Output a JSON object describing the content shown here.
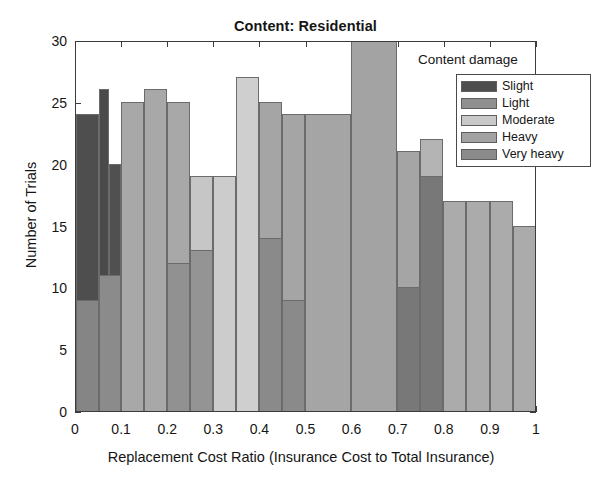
{
  "chart_data": {
    "type": "bar",
    "title": "Content: Residential",
    "xlabel": "Replacement Cost Ratio (Insurance Cost to Total Insurance)",
    "ylabel": "Number of Trials",
    "xlim": [
      0,
      1
    ],
    "ylim": [
      0,
      30
    ],
    "xticks": [
      "0",
      "0.1",
      "0.2",
      "0.3",
      "0.4",
      "0.5",
      "0.6",
      "0.7",
      "0.8",
      "0.9",
      "1"
    ],
    "xtick_values": [
      0,
      0.1,
      0.2,
      0.3,
      0.4,
      0.5,
      0.6,
      0.7,
      0.8,
      0.9,
      1
    ],
    "yticks": [
      "0",
      "5",
      "10",
      "15",
      "20",
      "25",
      "30"
    ],
    "ytick_values": [
      0,
      5,
      10,
      15,
      20,
      25,
      30
    ],
    "grid": false,
    "legend_title": "Content damage",
    "legend_position": "top-right-inside",
    "bin_width": 0.05,
    "series": [
      {
        "name": "Slight",
        "color": "#4e4e4e",
        "bars": [
          {
            "x0": 0.0,
            "x1": 0.05,
            "value": 24
          },
          {
            "x0": 0.05,
            "x1": 0.075,
            "value": 26
          },
          {
            "x0": 0.075,
            "x1": 0.1,
            "value": 20
          }
        ]
      },
      {
        "name": "Light",
        "color": "#8f8f8f",
        "bars": [
          {
            "x0": 0.0,
            "x1": 0.05,
            "value": 9
          },
          {
            "x0": 0.05,
            "x1": 0.1,
            "value": 11
          },
          {
            "x0": 0.1,
            "x1": 0.15,
            "value": 25
          },
          {
            "x0": 0.15,
            "x1": 0.2,
            "value": 26
          },
          {
            "x0": 0.2,
            "x1": 0.25,
            "value": 25
          },
          {
            "x0": 0.25,
            "x1": 0.3,
            "value": 19
          },
          {
            "x0": 0.3,
            "x1": 0.35,
            "value": 19
          }
        ]
      },
      {
        "name": "Moderate",
        "color": "#c2c2c2",
        "bars": [
          {
            "x0": 0.2,
            "x1": 0.25,
            "value": 12
          },
          {
            "x0": 0.25,
            "x1": 0.3,
            "value": 13
          },
          {
            "x0": 0.3,
            "x1": 0.35,
            "value": 19
          },
          {
            "x0": 0.35,
            "x1": 0.4,
            "value": 27
          },
          {
            "x0": 0.4,
            "x1": 0.45,
            "value": 25
          },
          {
            "x0": 0.75,
            "x1": 0.8,
            "value": 22
          },
          {
            "x0": 0.8,
            "x1": 0.85,
            "value": 17
          },
          {
            "x0": 0.85,
            "x1": 0.9,
            "value": 17
          },
          {
            "x0": 0.9,
            "x1": 0.95,
            "value": 17
          },
          {
            "x0": 0.95,
            "x1": 1.0,
            "value": 15
          }
        ]
      },
      {
        "name": "Heavy",
        "color": "#9e9e9e",
        "bars": [
          {
            "x0": 0.4,
            "x1": 0.45,
            "value": 14
          },
          {
            "x0": 0.45,
            "x1": 0.5,
            "value": 9
          },
          {
            "x0": 0.45,
            "x1": 0.5,
            "value": 25
          },
          {
            "x0": 0.5,
            "x1": 0.6,
            "value": 24
          },
          {
            "x0": 0.6,
            "x1": 0.7,
            "value": 30
          },
          {
            "x0": 0.7,
            "x1": 0.75,
            "value": 21
          },
          {
            "x0": 0.75,
            "x1": 0.8,
            "value": 19
          }
        ]
      },
      {
        "name": "Very heavy",
        "color": "#777777",
        "bars": [
          {
            "x0": 0.7,
            "x1": 0.75,
            "value": 10
          },
          {
            "x0": 0.75,
            "x1": 0.8,
            "value": 19
          }
        ]
      }
    ],
    "legend_entries": [
      {
        "label": "Slight",
        "color": "#4e4e4e"
      },
      {
        "label": "Light",
        "color": "#8f8f8f"
      },
      {
        "label": "Moderate",
        "color": "#c9c9c9"
      },
      {
        "label": "Heavy",
        "color": "#a2a2a2"
      },
      {
        "label": "Very heavy",
        "color": "#8a8a8a"
      }
    ],
    "drawn_bars": [
      {
        "x0": 0.0,
        "x1": 0.05,
        "value": 24,
        "color": "#4e4e4e",
        "z": 3
      },
      {
        "x0": 0.05,
        "x1": 0.072,
        "value": 26,
        "color": "#4a4a4a",
        "z": 4
      },
      {
        "x0": 0.072,
        "x1": 0.097,
        "value": 20,
        "color": "#505050",
        "z": 4
      },
      {
        "x0": 0.0,
        "x1": 0.05,
        "value": 9,
        "color": "#858585",
        "z": 5
      },
      {
        "x0": 0.05,
        "x1": 0.097,
        "value": 11,
        "color": "#8b8b8b",
        "z": 5
      },
      {
        "x0": 0.097,
        "x1": 0.147,
        "value": 25,
        "color": "#a8a8a8",
        "z": 2
      },
      {
        "x0": 0.147,
        "x1": 0.197,
        "value": 26,
        "color": "#a8a8a8",
        "z": 2
      },
      {
        "x0": 0.197,
        "x1": 0.247,
        "value": 25,
        "color": "#a8a8a8",
        "z": 2
      },
      {
        "x0": 0.197,
        "x1": 0.247,
        "value": 12,
        "color": "#919191",
        "z": 5
      },
      {
        "x0": 0.247,
        "x1": 0.297,
        "value": 19,
        "color": "#c6c6c6",
        "z": 2
      },
      {
        "x0": 0.247,
        "x1": 0.297,
        "value": 13,
        "color": "#949494",
        "z": 5
      },
      {
        "x0": 0.297,
        "x1": 0.347,
        "value": 19,
        "color": "#cccccc",
        "z": 2
      },
      {
        "x0": 0.347,
        "x1": 0.397,
        "value": 27,
        "color": "#cfcfcf",
        "z": 2
      },
      {
        "x0": 0.397,
        "x1": 0.447,
        "value": 25,
        "color": "#a5a5a5",
        "z": 2
      },
      {
        "x0": 0.397,
        "x1": 0.447,
        "value": 14,
        "color": "#8a8a8a",
        "z": 5
      },
      {
        "x0": 0.447,
        "x1": 0.497,
        "value": 24,
        "color": "#a5a5a5",
        "z": 2
      },
      {
        "x0": 0.447,
        "x1": 0.497,
        "value": 9,
        "color": "#8a8a8a",
        "z": 5
      },
      {
        "x0": 0.497,
        "x1": 0.597,
        "value": 24,
        "color": "#a5a5a5",
        "z": 2
      },
      {
        "x0": 0.597,
        "x1": 0.697,
        "value": 30,
        "color": "#a3a3a3",
        "z": 2
      },
      {
        "x0": 0.697,
        "x1": 0.747,
        "value": 21,
        "color": "#a5a5a5",
        "z": 2
      },
      {
        "x0": 0.697,
        "x1": 0.747,
        "value": 10,
        "color": "#787878",
        "z": 5
      },
      {
        "x0": 0.747,
        "x1": 0.797,
        "value": 22,
        "color": "#b4b4b4",
        "z": 2
      },
      {
        "x0": 0.747,
        "x1": 0.797,
        "value": 19,
        "color": "#787878",
        "z": 5
      },
      {
        "x0": 0.797,
        "x1": 0.847,
        "value": 17,
        "color": "#ababab",
        "z": 2
      },
      {
        "x0": 0.847,
        "x1": 0.897,
        "value": 17,
        "color": "#ababab",
        "z": 2
      },
      {
        "x0": 0.897,
        "x1": 0.947,
        "value": 17,
        "color": "#ababab",
        "z": 2
      },
      {
        "x0": 0.947,
        "x1": 0.997,
        "value": 15,
        "color": "#ababab",
        "z": 2
      }
    ]
  }
}
